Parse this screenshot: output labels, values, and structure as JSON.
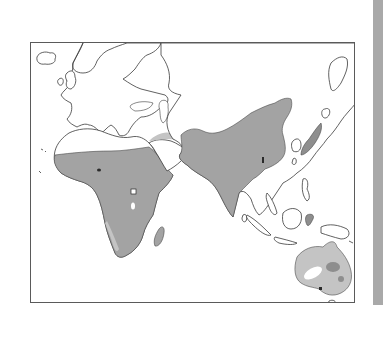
{
  "figure": {
    "type": "distribution-map",
    "region": "Old World (Europe, Africa, Asia, Australia)",
    "labels": []
  },
  "colors": {
    "background": "#ffffff",
    "frame_border": "#5a5a5a",
    "coastline": "#3a3a3a",
    "range_primary": "#a3a3a3",
    "range_secondary": "#c4c4c4",
    "range_dark_patch": "#8e8e8e",
    "marker": "#2a2a2a",
    "page_edge": "#a9a9a9"
  },
  "shaded_regions": [
    {
      "name": "sub-saharan-africa",
      "shade": "range_primary"
    },
    {
      "name": "arabian-coast-strip",
      "shade": "range_secondary"
    },
    {
      "name": "south-asia",
      "shade": "range_primary"
    },
    {
      "name": "east-asia",
      "shade": "range_primary"
    },
    {
      "name": "madagascar",
      "shade": "range_primary"
    },
    {
      "name": "australia",
      "shade": "range_secondary"
    }
  ]
}
